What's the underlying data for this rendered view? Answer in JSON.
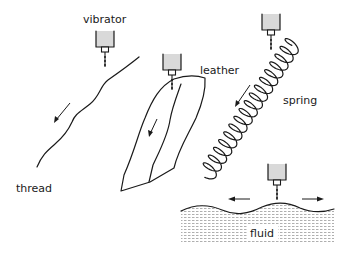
{
  "diagram": {
    "title": "",
    "labels": {
      "vibrator": "vibrator",
      "leather": "leather",
      "spring": "spring",
      "thread": "thread",
      "fluid": "fluid"
    },
    "panels": [
      {
        "name": "thread",
        "description": "vibrator exciting a wavy thread; arrow shows wave travel down the thread"
      },
      {
        "name": "leather",
        "description": "vibrator exciting a leather sheet; arrow shows wave travel"
      },
      {
        "name": "spring",
        "description": "vibrator exciting a coil spring; arrow shows wave travel"
      },
      {
        "name": "fluid",
        "description": "vibrator exciting a fluid surface; arrows show waves spreading left and right"
      }
    ],
    "colors": {
      "ink": "#1a1a1a",
      "vibrator_fill": "#d9d9d9",
      "fluid_hatch": "#9a9a9a"
    }
  }
}
